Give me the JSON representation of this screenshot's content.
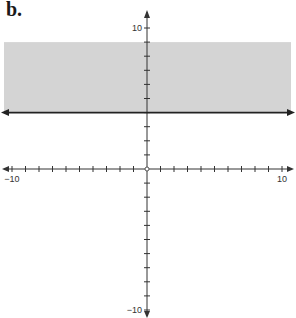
{
  "figure_label": "b.",
  "chart_data": {
    "type": "area",
    "title": "",
    "xlim": [
      -10,
      10
    ],
    "ylim": [
      -10,
      10
    ],
    "x_tick_step": 1,
    "y_tick_step": 1,
    "x_tick_labels": [
      {
        "value": -10,
        "label": "-10"
      },
      {
        "value": 10,
        "label": "10"
      }
    ],
    "y_tick_labels": [
      {
        "value": 10,
        "label": "10"
      },
      {
        "value": -10,
        "label": "-10"
      }
    ],
    "boundary": {
      "equation": "y = 4",
      "style": "solid",
      "y": 4
    },
    "shaded_region": {
      "inequality": "y >= 4",
      "y_from": 4,
      "y_to": 9,
      "color": "#d4d4d4"
    },
    "grid": false,
    "colors": {
      "axis": "#333333",
      "boundary": "#222222",
      "shade": "#d4d4d4"
    }
  }
}
